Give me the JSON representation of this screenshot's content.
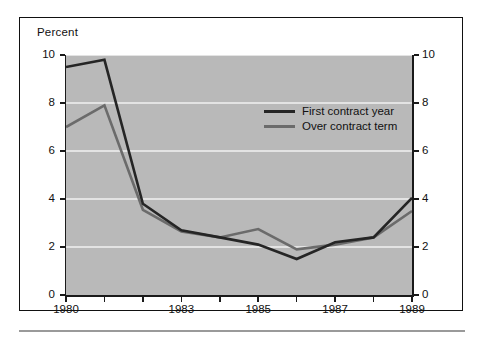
{
  "figure": {
    "axis_title": "Percent"
  },
  "chart_data": {
    "type": "line",
    "title": "",
    "xlabel": "",
    "ylabel": "Percent",
    "x": [
      1980,
      1981,
      1982,
      1983,
      1984,
      1985,
      1986,
      1987,
      1988,
      1989
    ],
    "xlim": [
      1980,
      1989
    ],
    "ylim": [
      0,
      10
    ],
    "ytick_labels": [
      "0",
      "2",
      "4",
      "6",
      "8",
      "10"
    ],
    "ytick_values": [
      0,
      2,
      4,
      6,
      8,
      10
    ],
    "ytick_labels_right": [
      "0",
      "2",
      "4",
      "6",
      "8",
      "10"
    ],
    "xtick_values": [
      1980,
      1981,
      1982,
      1983,
      1984,
      1985,
      1986,
      1987,
      1988,
      1989
    ],
    "xtick_labels": [
      "1980",
      "",
      "",
      "1983",
      "",
      "1985",
      "",
      "1987",
      "",
      "1989"
    ],
    "xtick_labels_shown": [
      "1980",
      "1983",
      "1985",
      "1987",
      "1989"
    ],
    "grid": "horizontal-white",
    "legend_position": "upper-center-right",
    "plot_background": "#b9b9b9",
    "series": [
      {
        "name": "First contract year",
        "color": "#252525",
        "values": [
          9.5,
          9.8,
          3.8,
          2.7,
          2.4,
          2.1,
          1.5,
          2.2,
          2.4,
          4.05
        ]
      },
      {
        "name": "Over contract term",
        "color": "#6b6b6b",
        "values": [
          7.0,
          7.9,
          3.55,
          2.65,
          2.4,
          2.75,
          1.9,
          2.1,
          2.4,
          3.5
        ]
      }
    ]
  },
  "legend": {
    "items": [
      {
        "label": "First contract year",
        "color": "#252525"
      },
      {
        "label": "Over contract term",
        "color": "#6b6b6b"
      }
    ]
  },
  "colors": {
    "series_first_contract_year": "#252525",
    "series_over_contract_term": "#6b6b6b",
    "plot_panel": "#b9b9b9",
    "gridline": "#f2f2f2",
    "frame": "#111111",
    "rule": "#9a9a9a"
  }
}
